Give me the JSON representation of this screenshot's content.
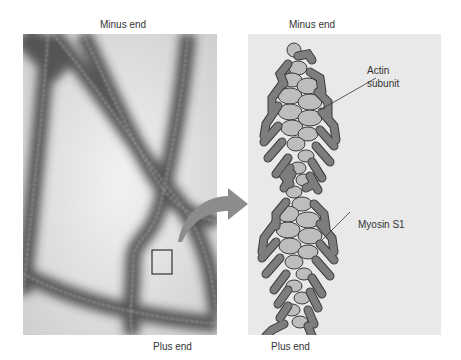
{
  "figure": {
    "left_panel": {
      "type": "electron-micrograph",
      "top_label": "Minus end",
      "bottom_label": "Plus end"
    },
    "right_panel": {
      "type": "schematic",
      "top_label": "Minus end",
      "bottom_label": "Plus end",
      "annotations": [
        {
          "id": "actin",
          "text_line1": "Actin",
          "text_line2": "subunit"
        },
        {
          "id": "myosin",
          "text": "Myosin S1"
        }
      ]
    },
    "colors": {
      "actin_subunit": "#bdbdbd",
      "myosin_head": "#7d7d7d",
      "outline": "#3a3a3a",
      "arrow": "#8c8c8c",
      "panel_bg": "#e9e9e9"
    }
  }
}
